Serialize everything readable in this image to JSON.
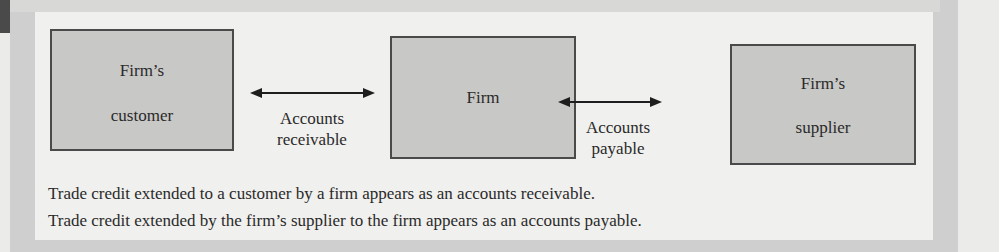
{
  "diagram": {
    "nodes": [
      {
        "id": "customer",
        "line1": "Firm’s",
        "line2": "customer"
      },
      {
        "id": "firm",
        "line1": "Firm"
      },
      {
        "id": "supplier",
        "line1": "Firm’s",
        "line2": "supplier"
      }
    ],
    "edges": [
      {
        "from": "customer",
        "to": "firm",
        "line1": "Accounts",
        "line2": "receivable",
        "direction": "bidirectional"
      },
      {
        "from": "firm",
        "to": "supplier",
        "line1": "Accounts",
        "line2": "payable",
        "direction": "bidirectional"
      }
    ],
    "captions": [
      "Trade credit extended to a customer by a firm appears as an accounts receivable.",
      "Trade credit extended by the firm’s supplier to the firm appears as an accounts payable."
    ]
  },
  "colors": {
    "box_fill": "#c8c8c6",
    "box_border": "#4a4a4a",
    "panel": "#f0f0ee",
    "frame": "#cfcfcf"
  }
}
